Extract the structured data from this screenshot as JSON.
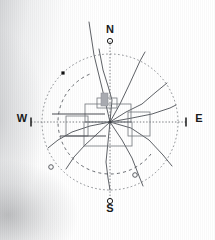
{
  "figure": {
    "title": "",
    "type": "compass-rose-network-diagram",
    "center": {
      "x": 110,
      "y": 122
    },
    "background_note": "light gray gradient smudge on left and lower-left edge"
  },
  "colors": {
    "stroke": "#5a5d63",
    "stroke_dark": "#3c3f44",
    "axis": "#6b6e73",
    "label": "#1a1a1a",
    "fill_gray": "#a8aab0",
    "marker_filled": "#111111",
    "background": "#ffffff"
  },
  "cardinals": [
    {
      "name": "north",
      "label": "N",
      "x": 110,
      "y": 33,
      "marker": "open-circle",
      "marker_x": 110,
      "marker_y": 41
    },
    {
      "name": "south",
      "label": "S",
      "x": 110,
      "y": 212,
      "marker": "open-circle",
      "marker_x": 110,
      "marker_y": 201
    },
    {
      "name": "east",
      "label": "E",
      "x": 199,
      "y": 122,
      "marker": "tick",
      "marker_x": 186,
      "marker_y": 122
    },
    {
      "name": "west",
      "label": "W",
      "x": 22,
      "y": 122,
      "marker": "tick",
      "marker_x": 31,
      "marker_y": 122
    }
  ],
  "outer_circle": {
    "name": "outer-dotted-circle",
    "cx": 110,
    "cy": 122,
    "r": 68,
    "style": "dotted",
    "dash": "1.6 2.4"
  },
  "inner_arc": {
    "name": "inner-dashed-arc",
    "cx": 110,
    "cy": 122,
    "r": 52,
    "style": "dashed",
    "dash": "3 3.2",
    "start_angle_deg": 128,
    "end_angle_deg": 340
  },
  "markers": [
    {
      "name": "marker-filled-square",
      "shape": "filled-square",
      "x": 63,
      "y": 73,
      "size": 3.2
    },
    {
      "name": "marker-open-circle-left",
      "shape": "open-circle",
      "x": 51,
      "y": 167,
      "r": 2.3
    },
    {
      "name": "marker-open-circle-right",
      "shape": "open-circle",
      "x": 135,
      "y": 175,
      "r": 2.3
    }
  ],
  "radial_branches": [
    {
      "name": "branch-north-long",
      "points": "110,122 103,92 94,55 89,22"
    },
    {
      "name": "branch-north-upper",
      "points": "110,122 112,100 108,86 103,70 99,49"
    },
    {
      "name": "branch-nne",
      "points": "110,122 120,104 130,83 140,61 145,52"
    },
    {
      "name": "branch-ne",
      "points": "110,122 126,112 142,104 156,92 167,83"
    },
    {
      "name": "branch-ene",
      "points": "110,122 132,118 152,114 170,108 176,105"
    },
    {
      "name": "branch-ese",
      "points": "110,122 131,128 149,140 163,155 172,166"
    },
    {
      "name": "branch-se",
      "points": "110,122 122,140 132,158 139,176 143,186"
    },
    {
      "name": "branch-s",
      "points": "110,122 108,142 106,162 108,178 110,190"
    },
    {
      "name": "branch-ssw",
      "points": "110,122 97,134 85,145 74,157 66,169"
    },
    {
      "name": "branch-wsw",
      "points": "110,122 90,126 72,132 58,140 48,148"
    }
  ],
  "center_rectangles": [
    {
      "name": "center-rect-upper",
      "x": 85,
      "y": 104,
      "w": 46,
      "h": 18
    },
    {
      "name": "center-rect-lower",
      "x": 84,
      "y": 122,
      "w": 48,
      "h": 24
    },
    {
      "name": "center-rect-left",
      "x": 66,
      "y": 116,
      "w": 22,
      "h": 20
    },
    {
      "name": "center-rect-right",
      "x": 128,
      "y": 112,
      "w": 22,
      "h": 24
    },
    {
      "name": "center-rect-small-top",
      "x": 97,
      "y": 98,
      "w": 20,
      "h": 10
    }
  ],
  "center_shaded_block": {
    "name": "shaded-block",
    "x": 101,
    "y": 93,
    "w": 7,
    "h": 13
  },
  "axis_lines": {
    "horizontal": {
      "name": "west-east-axis",
      "x1": 31,
      "y1": 122,
      "x2": 186,
      "y2": 122,
      "style": "dotted"
    },
    "vertical": {
      "name": "north-south-axis",
      "x1": 110,
      "y1": 41,
      "x2": 110,
      "y2": 201,
      "style": "dotted"
    },
    "solid_west_segment": {
      "name": "solid-west-lead",
      "x1": 52,
      "y1": 114,
      "x2": 105,
      "y2": 114
    },
    "solid_west_segment_lower": {
      "name": "solid-west-lead-lower",
      "x1": 60,
      "y1": 136,
      "x2": 106,
      "y2": 136
    }
  }
}
